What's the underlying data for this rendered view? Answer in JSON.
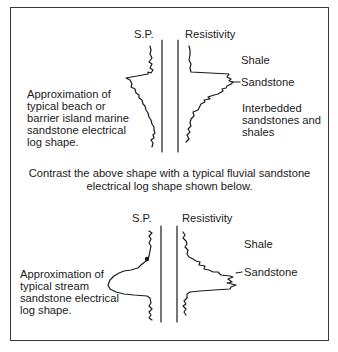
{
  "top_panel": {
    "sp_label": "S.P.",
    "resistivity_label": "Resistivity",
    "description_lines": [
      "Approximation of",
      "typical beach or",
      "barrier island marine",
      "sandstone electrical",
      "log shape."
    ],
    "right_labels": {
      "shale": "Shale",
      "sandstone": "Sandstone",
      "interbedded_lines": [
        "Interbedded",
        "sandstones and",
        "shales"
      ]
    }
  },
  "contrast_text": {
    "line1": "Contrast the above shape with a typical fluvial sandstone",
    "line2": "electrical log shape shown below."
  },
  "bottom_panel": {
    "sp_label": "S.P.",
    "resistivity_label": "Resistivity",
    "description_lines": [
      "Approximation of",
      "typical stream",
      "sandstone electrical",
      "log shape."
    ],
    "right_labels": {
      "shale": "Shale",
      "sandstone": "Sandstone"
    }
  },
  "colors": {
    "ink": "#1a1a1a",
    "border": "#3a3a3a",
    "background": "#ffffff"
  }
}
